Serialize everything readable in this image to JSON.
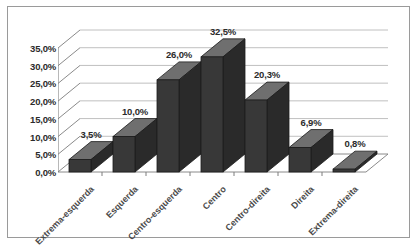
{
  "chart_data": {
    "type": "bar",
    "title": "",
    "subtitle": "",
    "xlabel": "",
    "ylabel": "",
    "categories": [
      "Extrema-esquerda",
      "Esquerda",
      "Centro-esquerda",
      "Centro",
      "Centro-direita",
      "Direita",
      "Extrema-direita"
    ],
    "values": [
      3.5,
      10.0,
      26.0,
      32.5,
      20.3,
      6.9,
      0.8
    ],
    "data_labels": [
      "3,5%",
      "10,0%",
      "26,0%",
      "32,5%",
      "20,3%",
      "6,9%",
      "0,8%"
    ],
    "ylim": [
      0,
      35
    ],
    "ytick_values": [
      0,
      5,
      10,
      15,
      20,
      25,
      30,
      35
    ],
    "ytick_labels": [
      "0,0%",
      "5,0%",
      "10,0%",
      "15,0%",
      "20,0%",
      "25,0%",
      "30,0%",
      "35,0%"
    ],
    "grid": true,
    "legend": false,
    "legend_position": "none",
    "style": "3d-column",
    "colors": {
      "bar_front": "#383838",
      "bar_top": "#6f6f6f",
      "bar_side": "#2a2a2a",
      "bar_outline": "#1c1c1c",
      "gridline": "#b9b9b9",
      "axis": "#7d7d7d",
      "border": "#9a9a9a",
      "background": "#ffffff",
      "tick_text": "#2b2b2b",
      "category_text": "#4a4a4a"
    }
  }
}
